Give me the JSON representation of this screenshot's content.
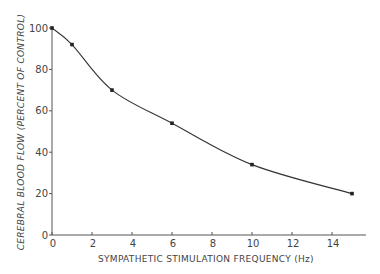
{
  "chart_data": {
    "type": "line",
    "title": "",
    "xlabel": "SYMPATHETIC STIMULATION FREQUENCY (Hz)",
    "ylabel": "CEREBRAL BLOOD FLOW (PERCENT OF CONTROL)",
    "x": [
      0,
      1,
      3,
      6,
      10,
      15
    ],
    "series": [
      {
        "name": "Cerebral blood flow",
        "values": [
          100,
          92,
          70,
          54,
          34,
          20
        ]
      }
    ],
    "xlim": [
      0,
      15.7
    ],
    "ylim": [
      0,
      100
    ],
    "xticks": [
      0,
      2,
      4,
      6,
      8,
      10,
      12,
      14
    ],
    "yticks": [
      0,
      20,
      40,
      60,
      80,
      100
    ],
    "grid": false,
    "legend": null,
    "colors": {
      "line": "#333333",
      "marker": "#222222",
      "axis": "#555555"
    }
  }
}
